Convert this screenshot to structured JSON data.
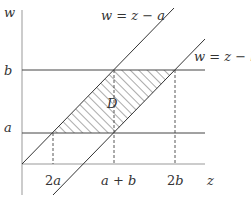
{
  "diagram": {
    "axes": {
      "vertical_label": "w",
      "horizontal_label": "z"
    },
    "horizontal_lines": [
      {
        "label": "b",
        "name": "line-w-equals-b"
      },
      {
        "label": "a",
        "name": "line-w-equals-a"
      }
    ],
    "diagonal_lines": [
      {
        "label": "w = z − a"
      },
      {
        "label": "w = z − b"
      }
    ],
    "region_label": "D",
    "z_ticks": [
      {
        "coef": "2",
        "var": "a"
      },
      {
        "label": "a + b"
      },
      {
        "coef": "2",
        "var": "b"
      }
    ],
    "colors": {
      "line": "#333333",
      "hatch": "#444444",
      "background": "#ffffff"
    }
  }
}
